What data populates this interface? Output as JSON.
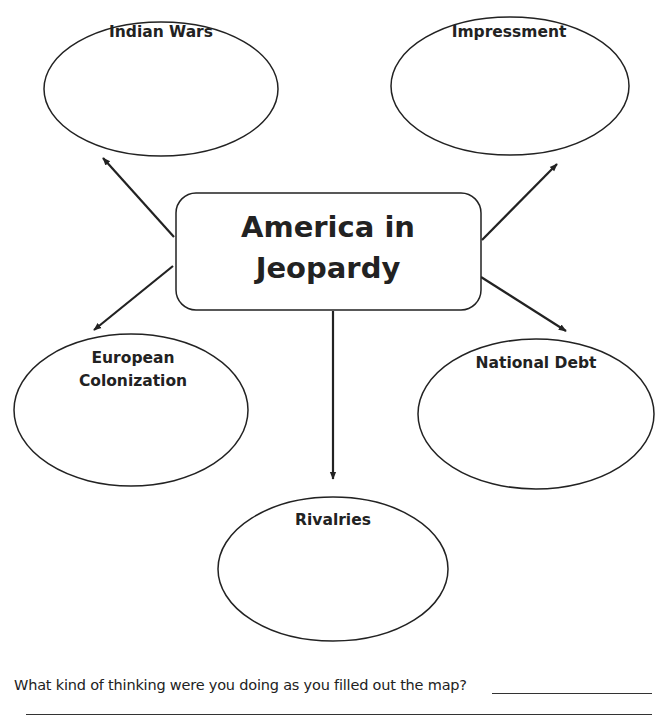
{
  "diagram": {
    "center_node": {
      "lines": [
        "America in",
        "Jeopardy"
      ]
    },
    "nodes": [
      {
        "id": "indian-wars",
        "lines": [
          "Indian Wars"
        ]
      },
      {
        "id": "impressment",
        "lines": [
          "Impressment"
        ]
      },
      {
        "id": "european-colonization",
        "lines": [
          "European",
          "Colonization"
        ]
      },
      {
        "id": "national-debt",
        "lines": [
          "National Debt"
        ]
      },
      {
        "id": "rivalries",
        "lines": [
          "Rivalries"
        ]
      }
    ],
    "colors": {
      "stroke": "#222222",
      "text": "#222222",
      "background": "#ffffff"
    }
  },
  "footer": {
    "question": "What kind of thinking were you doing as you filled out the map?"
  }
}
